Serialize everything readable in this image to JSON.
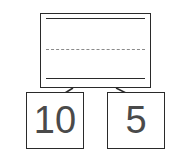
{
  "diagram": {
    "type": "number-bond",
    "whole": {
      "value": "",
      "lines": [
        "solid",
        "dashed",
        "solid"
      ]
    },
    "parts": [
      {
        "value": "10"
      },
      {
        "value": "5"
      }
    ],
    "colors": {
      "stroke": "#2a2a2a",
      "dash": "#8a8a8a",
      "text": "#4a4a4a"
    }
  }
}
